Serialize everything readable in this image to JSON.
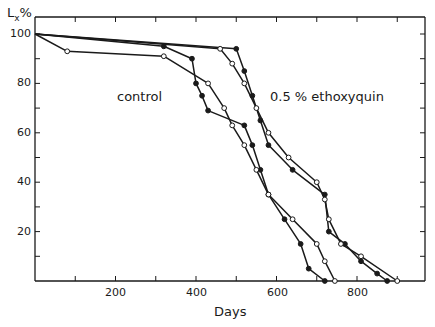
{
  "chart_data": {
    "type": "line",
    "title": "",
    "xlabel": "Days",
    "ylabel": "Lx%",
    "xlim": [
      0,
      925
    ],
    "ylim": [
      0,
      105
    ],
    "x_ticks": [
      200,
      400,
      600,
      800
    ],
    "y_ticks": [
      20,
      40,
      60,
      80,
      100
    ],
    "grid": false,
    "annotations": [
      "control",
      "0.5 % ethoxyquin"
    ],
    "series": [
      {
        "name": "control (filled)",
        "marker": "filled-circle",
        "group": "control",
        "x": [
          0,
          320,
          390,
          400,
          415,
          430,
          520,
          540,
          560,
          580,
          620,
          660,
          680,
          720
        ],
        "y": [
          100,
          95,
          90,
          80,
          75,
          69,
          63,
          55,
          45,
          35,
          25,
          15,
          5,
          0
        ]
      },
      {
        "name": "control (open)",
        "marker": "open-circle",
        "group": "control",
        "x": [
          0,
          80,
          320,
          430,
          470,
          490,
          520,
          550,
          580,
          640,
          700,
          720,
          745
        ],
        "y": [
          100,
          93,
          91,
          80,
          70,
          63,
          55,
          45,
          35,
          25,
          15,
          8,
          0
        ]
      },
      {
        "name": "0.5% ethoxyquin (filled)",
        "marker": "filled-circle",
        "group": "ethoxyquin",
        "x": [
          0,
          500,
          520,
          540,
          560,
          580,
          640,
          720,
          730,
          770,
          810,
          850,
          875
        ],
        "y": [
          100,
          94,
          85,
          75,
          65,
          55,
          45,
          35,
          20,
          15,
          8,
          3,
          0
        ]
      },
      {
        "name": "0.5% ethoxyquin (open)",
        "marker": "open-circle",
        "group": "ethoxyquin",
        "x": [
          0,
          460,
          490,
          520,
          550,
          580,
          630,
          700,
          720,
          730,
          760,
          810,
          900
        ],
        "y": [
          100,
          94,
          88,
          80,
          70,
          60,
          50,
          40,
          33,
          25,
          15,
          10,
          0
        ]
      }
    ]
  },
  "labels": {
    "y_axis": "Lx%",
    "x_axis": "Days",
    "control": "control",
    "ethoxyquin": "0.5 %  ethoxyquin"
  },
  "ticks": {
    "y100": "100",
    "y80": "80",
    "y60": "60",
    "y40": "40",
    "y20": "20",
    "x200": "200",
    "x400": "400",
    "x600": "600",
    "x800": "800"
  },
  "colors": {
    "ink": "#1a1a1a",
    "background": "#ffffff"
  }
}
